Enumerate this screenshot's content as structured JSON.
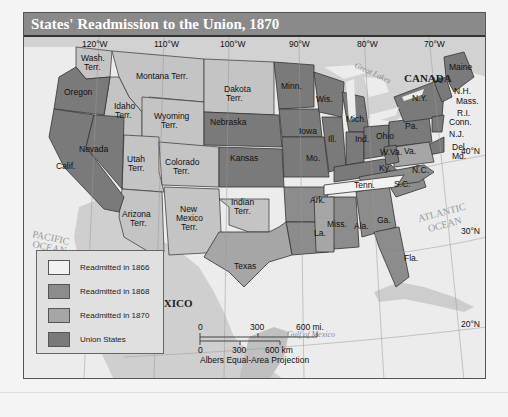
{
  "title": "States' Readmission to the Union, 1870",
  "colors": {
    "readmitted_1866": "#f2f2f2",
    "readmitted_1868": "#8c8c8c",
    "readmitted_1870": "#a6a6a6",
    "union_states": "#7a7a7a",
    "territory": "#c4c4c4",
    "water": "#ececec",
    "foreign_land": "#d0d0d0"
  },
  "legend": {
    "items": [
      {
        "label": "Readmitted in 1866",
        "color": "#f2f2f2"
      },
      {
        "label": "Readmitted in 1868",
        "color": "#8c8c8c"
      },
      {
        "label": "Readmitted in 1870",
        "color": "#a6a6a6"
      },
      {
        "label": "Union States",
        "color": "#7a7a7a"
      }
    ]
  },
  "longitudes": [
    "120°W",
    "110°W",
    "100°W",
    "90°W",
    "80°W",
    "70°W"
  ],
  "latitudes": [
    "40°N",
    "30°N",
    "20°N"
  ],
  "water_labels": {
    "pacific": [
      "PACIFIC",
      "OCEAN"
    ],
    "atlantic": [
      "ATLANTIC",
      "OCEAN"
    ],
    "gulf": "Gulf of Mexico",
    "great_lakes": "Great Lakes"
  },
  "countries": {
    "canada": "CANADA",
    "mexico": "MEXICO"
  },
  "regions": {
    "wash": [
      "Wash.",
      "Terr."
    ],
    "oregon": "Oregon",
    "calif": "Calif.",
    "nevada": "Nevada",
    "idaho": [
      "Idaho",
      "Terr."
    ],
    "montana": "Montana Terr.",
    "wyoming": [
      "Wyoming",
      "Terr."
    ],
    "utah": [
      "Utah",
      "Terr."
    ],
    "colorado": [
      "Colorado",
      "Terr."
    ],
    "arizona": [
      "Arizona",
      "Terr."
    ],
    "new_mexico": [
      "New",
      "Mexico",
      "Terr."
    ],
    "dakota": [
      "Dakota",
      "Terr."
    ],
    "nebraska": "Nebraska",
    "kansas": "Kansas",
    "indian": [
      "Indian",
      "Terr."
    ],
    "texas": "Texas",
    "minn": "Minn.",
    "iowa": "Iowa",
    "mo": "Mo.",
    "ark": "Ark.",
    "la": "La.",
    "wis": "Wis.",
    "ill": "Ill.",
    "mich": "Mich.",
    "ind": "Ind.",
    "ohio": "Ohio",
    "ky": "Ky.",
    "tenn": "Tenn.",
    "miss": "Miss.",
    "ala": "Ala.",
    "ga": "Ga.",
    "fla": "Fla.",
    "sc": "S.C.",
    "nc": "N.C.",
    "va": "Va.",
    "wva": "W.Va.",
    "pa": "Pa.",
    "ny": "N.Y.",
    "vt": "Vt.",
    "maine": "Maine",
    "nh": "N.H.",
    "mass": "Mass.",
    "ri": "R.I.",
    "conn": "Conn.",
    "nj": "N.J.",
    "del": "Del.",
    "md": "Md."
  },
  "scale_bar": {
    "miles": [
      "0",
      "300",
      "600 mi."
    ],
    "km": [
      "0",
      "300",
      "600 km"
    ],
    "projection": "Albers Equal-Area Projection"
  }
}
